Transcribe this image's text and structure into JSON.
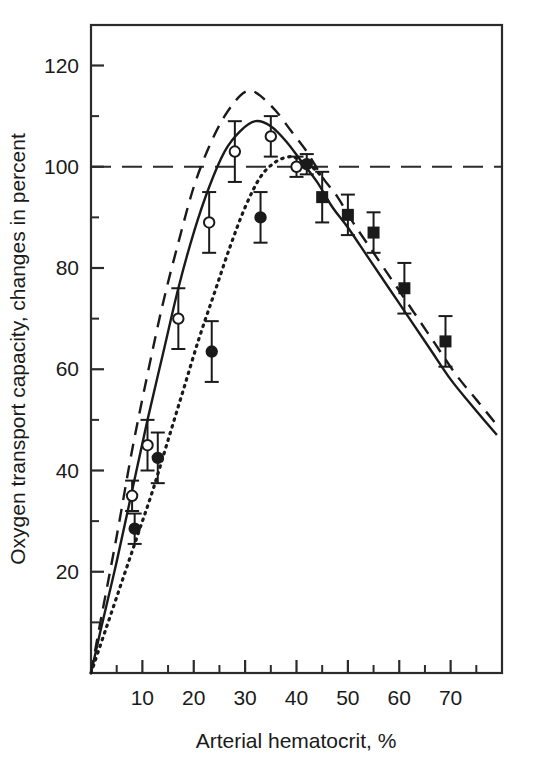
{
  "chart_data": {
    "type": "line",
    "title": "",
    "xlabel": "Arterial hematocrit, %",
    "ylabel": "Oxygen transport capacity, changes in percent",
    "xlim": [
      0,
      80
    ],
    "ylim": [
      0,
      128
    ],
    "grid": false,
    "legend_position": "none",
    "x_ticks_major": [
      10,
      20,
      30,
      40,
      50,
      60,
      70
    ],
    "x_ticks_minor": [
      5,
      15,
      25,
      35,
      45,
      55,
      65,
      75
    ],
    "x_tick_labels": [
      "10",
      "20",
      "30",
      "40",
      "50",
      "60",
      "70"
    ],
    "y_ticks_major": [
      20,
      40,
      60,
      80,
      100,
      120
    ],
    "y_ticks_minor": [
      10,
      30,
      50,
      70,
      90,
      110
    ],
    "y_tick_labels": [
      "20",
      "40",
      "60",
      "80",
      "100",
      "120"
    ],
    "reference_line": {
      "name": "100-percent-reference",
      "style": "long-dashed",
      "y": 100,
      "x_from": 0,
      "x_to": 80
    },
    "series": [
      {
        "name": "dashed-upper-curve",
        "style": "dashed",
        "marker": "none",
        "x": [
          0,
          2,
          5,
          8,
          11,
          14,
          17,
          20,
          23,
          26,
          29,
          31,
          33,
          36,
          39,
          42,
          45,
          48,
          51,
          55,
          59,
          63,
          67,
          71,
          75,
          79
        ],
        "y": [
          0,
          11,
          27,
          44,
          59,
          73,
          85,
          96,
          104,
          110,
          114,
          115,
          114,
          111,
          107,
          103,
          98,
          94,
          89,
          83,
          77,
          71,
          65,
          59,
          54,
          49
        ]
      },
      {
        "name": "solid-curve",
        "style": "solid",
        "marker": "none",
        "x": [
          0,
          2,
          5,
          8,
          11,
          14,
          17,
          20,
          23,
          26,
          29,
          32,
          35,
          38,
          41,
          44,
          47,
          50,
          54,
          58,
          62,
          66,
          70,
          74,
          79
        ],
        "y": [
          0,
          9,
          22,
          36,
          50,
          63,
          76,
          87,
          96,
          103,
          107,
          109,
          108,
          105,
          101,
          97,
          92,
          88,
          82,
          76,
          70,
          64,
          58,
          53,
          47
        ]
      },
      {
        "name": "dotted-curve",
        "style": "dotted",
        "marker": "none",
        "x": [
          0,
          3,
          6,
          9,
          12,
          15,
          18,
          21,
          24,
          27,
          30,
          33,
          36,
          39,
          41,
          43,
          45
        ],
        "y": [
          0,
          9,
          18,
          27,
          36,
          46,
          56,
          66,
          75,
          84,
          92,
          98,
          101,
          102,
          101,
          100,
          98
        ]
      },
      {
        "name": "open-circle-data",
        "style": "markers",
        "marker": "open-circle",
        "points": [
          {
            "x": 8,
            "y": 35,
            "err": 3
          },
          {
            "x": 11,
            "y": 45,
            "err": 5
          },
          {
            "x": 17,
            "y": 70,
            "err": 6
          },
          {
            "x": 23,
            "y": 89,
            "err": 6
          },
          {
            "x": 28,
            "y": 103,
            "err": 6
          },
          {
            "x": 35,
            "y": 106,
            "err": 4
          },
          {
            "x": 40,
            "y": 100,
            "err": 2
          }
        ]
      },
      {
        "name": "filled-circle-data",
        "style": "markers",
        "marker": "filled-circle",
        "points": [
          {
            "x": 8.5,
            "y": 28.5,
            "err": 3
          },
          {
            "x": 13,
            "y": 42.5,
            "err": 5
          },
          {
            "x": 23.5,
            "y": 63.5,
            "err": 6
          },
          {
            "x": 33,
            "y": 90,
            "err": 5
          },
          {
            "x": 42,
            "y": 100.5,
            "err": 2
          }
        ]
      },
      {
        "name": "filled-square-data",
        "style": "markers",
        "marker": "filled-square",
        "points": [
          {
            "x": 45,
            "y": 94,
            "err": 5
          },
          {
            "x": 50,
            "y": 90.5,
            "err": 4
          },
          {
            "x": 55,
            "y": 87,
            "err": 4
          },
          {
            "x": 61,
            "y": 76,
            "err": 5
          },
          {
            "x": 69,
            "y": 65.5,
            "err": 5
          }
        ]
      }
    ]
  },
  "axis": {
    "x_title": "Arterial hematocrit, %",
    "y_title": "Oxygen transport capacity, changes in percent"
  }
}
